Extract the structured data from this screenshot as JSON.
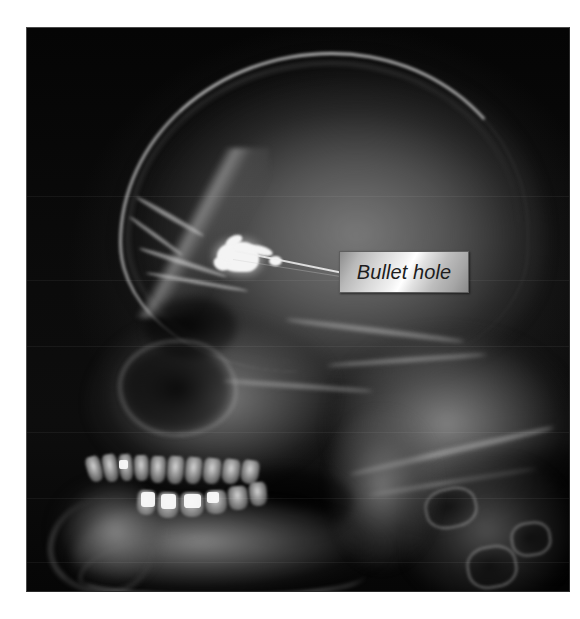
{
  "figure": {
    "name": "lateral-skull-radiograph",
    "modality_appearance": "grayscale x-ray film",
    "background_color": "#ffffff",
    "film_color": "#000000"
  },
  "annotation": {
    "callout_label": "Bullet hole",
    "label_style": "italic",
    "label_text_color": "#1d1d1d",
    "label_fill_light": "#ffffff",
    "label_fill_dark": "#8a8a8a",
    "label_border_color": "#5e5e5e",
    "leader_line_color": "#f0f0f0"
  },
  "caption": {
    "text": ""
  },
  "anatomy": {
    "bullet_fragment": "metallic-fragment",
    "cranium": "cranial-vault",
    "maxillary_sinus": "maxillary-sinus",
    "orbit": "orbit",
    "mandible": "mandible",
    "cervical_spine": "cervical-vertebrae",
    "teeth": "dental-arch"
  },
  "teeth": [
    {
      "left": 4,
      "top": 4,
      "w": 15,
      "h": 26,
      "rot": -16
    },
    {
      "left": 20,
      "top": 2,
      "w": 15,
      "h": 28,
      "rot": -10
    },
    {
      "left": 36,
      "top": 2,
      "w": 14,
      "h": 27,
      "rot": -6
    },
    {
      "left": 51,
      "top": 3,
      "w": 15,
      "h": 26,
      "rot": -2
    },
    {
      "left": 67,
      "top": 4,
      "w": 16,
      "h": 27,
      "rot": 2
    },
    {
      "left": 84,
      "top": 4,
      "w": 17,
      "h": 28,
      "rot": 4
    },
    {
      "left": 102,
      "top": 5,
      "w": 17,
      "h": 27,
      "rot": 6
    },
    {
      "left": 120,
      "top": 6,
      "w": 18,
      "h": 26,
      "rot": 7
    },
    {
      "left": 139,
      "top": 7,
      "w": 18,
      "h": 25,
      "rot": 8
    },
    {
      "left": 158,
      "top": 8,
      "w": 18,
      "h": 24,
      "rot": 9
    },
    {
      "left": 54,
      "top": 38,
      "w": 19,
      "h": 25,
      "rot": 4
    },
    {
      "left": 74,
      "top": 40,
      "w": 22,
      "h": 26,
      "rot": 2
    },
    {
      "left": 97,
      "top": 40,
      "w": 24,
      "h": 25,
      "rot": 0
    },
    {
      "left": 122,
      "top": 38,
      "w": 22,
      "h": 24,
      "rot": -2
    },
    {
      "left": 145,
      "top": 34,
      "w": 20,
      "h": 24,
      "rot": -4
    },
    {
      "left": 166,
      "top": 30,
      "w": 18,
      "h": 24,
      "rot": -5
    }
  ],
  "fillings": [
    {
      "left": 58,
      "top": 40,
      "w": 14,
      "h": 15
    },
    {
      "left": 78,
      "top": 42,
      "w": 15,
      "h": 15
    },
    {
      "left": 101,
      "top": 42,
      "w": 17,
      "h": 14
    },
    {
      "left": 36,
      "top": 8,
      "w": 9,
      "h": 9
    },
    {
      "left": 124,
      "top": 40,
      "w": 12,
      "h": 11
    }
  ],
  "artefact_lines": [
    168,
    252,
    318,
    404,
    470,
    534
  ]
}
